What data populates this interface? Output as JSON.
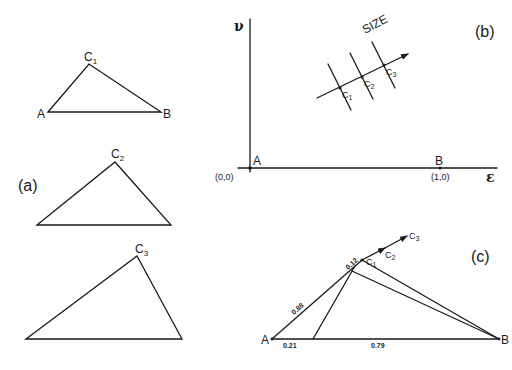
{
  "panel_a": {
    "label": "(a)",
    "triangles": [
      {
        "vertex_a": "A",
        "vertex_b": "B",
        "vertex_c": "C",
        "vertex_c_sub": "1"
      },
      {
        "vertex_c": "C",
        "vertex_c_sub": "2"
      },
      {
        "vertex_c": "C",
        "vertex_c_sub": "3"
      }
    ]
  },
  "panel_b": {
    "label": "(b)",
    "y_axis_label": "ν",
    "x_axis_label": "ε",
    "origin_point": "A",
    "origin_coord": "(0,0)",
    "unit_point": "B",
    "unit_coord": "(1,0)",
    "arrow_label": "SIZE",
    "points": [
      {
        "label": "C",
        "sub": "1"
      },
      {
        "label": "C",
        "sub": "2"
      },
      {
        "label": "C",
        "sub": "3"
      }
    ]
  },
  "panel_c": {
    "label": "(c)",
    "vertex_a": "A",
    "vertex_b": "B",
    "points": [
      {
        "label": "C",
        "sub": "1"
      },
      {
        "label": "C",
        "sub": "2"
      },
      {
        "label": "C",
        "sub": "3"
      }
    ],
    "segment_labels": {
      "ac_long": "0.88",
      "ac_short": "0.12",
      "ab_left": "0.21",
      "ab_right": "0.79"
    }
  }
}
